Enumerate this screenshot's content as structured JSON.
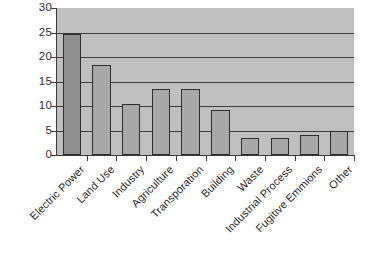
{
  "chart_data": {
    "type": "bar",
    "title": "",
    "subtitle": "",
    "xlabel": "",
    "ylabel": "",
    "ylim": [
      0,
      30
    ],
    "yticks": [
      0,
      5,
      10,
      15,
      20,
      25,
      30
    ],
    "ytick_labels": [
      "0",
      "5",
      "10",
      "15",
      "20",
      "25",
      "30"
    ],
    "grid": true,
    "legend": false,
    "legend_position": "none",
    "categories": [
      "Electric Power",
      "Land Use",
      "Industry",
      "Agriculture",
      "Transporation",
      "Building",
      "Waste",
      "Industrial Process",
      "Fugitive Emmions",
      "Other"
    ],
    "values": [
      24.7,
      18.4,
      10.4,
      13.5,
      13.5,
      9.1,
      3.5,
      3.5,
      4.0,
      5.0
    ],
    "colors": {
      "plot_background": "#bfbfbf",
      "bar_fill": "#a8a8a8",
      "bar_fill_first": "#8f8f8f",
      "bar_edge": "#2e2e2e",
      "gridline": "#3d3d3d",
      "axis": "#3a3a3a",
      "text": "#1f1f1f",
      "page_background": "#ffffff"
    }
  }
}
